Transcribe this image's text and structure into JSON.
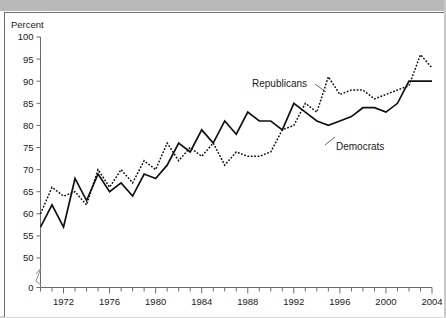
{
  "figure": {
    "y_axis_title": "Percent",
    "series_labels": {
      "republicans": "Republicans",
      "democrats": "Democrats"
    }
  },
  "chart_data": {
    "type": "line",
    "title": "",
    "xlabel": "",
    "ylabel": "Percent",
    "xlim": [
      1970,
      2004
    ],
    "ylim": [
      50,
      100
    ],
    "y_axis_break_to_zero": true,
    "grid": false,
    "legend": "inline-annotations",
    "ytick_labels": [
      "0",
      "50",
      "55",
      "60",
      "65",
      "70",
      "75",
      "80",
      "85",
      "90",
      "95",
      "100"
    ],
    "ytick_values": [
      0,
      50,
      55,
      60,
      65,
      70,
      75,
      80,
      85,
      90,
      95,
      100
    ],
    "xtick_labels": [
      "1972",
      "1976",
      "1980",
      "1984",
      "1988",
      "1992",
      "1996",
      "2000",
      "2004"
    ],
    "xtick_values": [
      1972,
      1976,
      1980,
      1984,
      1988,
      1992,
      1996,
      2000,
      2004
    ],
    "x_minor_ticks_every": 1,
    "x": [
      1970,
      1971,
      1972,
      1973,
      1974,
      1975,
      1976,
      1977,
      1978,
      1979,
      1980,
      1981,
      1982,
      1983,
      1984,
      1985,
      1986,
      1987,
      1988,
      1989,
      1990,
      1991,
      1992,
      1993,
      1994,
      1995,
      1996,
      1997,
      1998,
      1999,
      2000,
      2001,
      2002,
      2003,
      2004
    ],
    "series": [
      {
        "name": "Democrats",
        "style": "solid",
        "color": "#111111",
        "values": [
          57,
          62,
          57,
          68,
          63,
          69,
          65,
          67,
          64,
          69,
          68,
          71,
          76,
          74,
          79,
          76,
          81,
          78,
          83,
          81,
          81,
          79,
          85,
          83,
          81,
          80,
          81,
          82,
          84,
          84,
          83,
          85,
          90,
          90,
          90
        ]
      },
      {
        "name": "Republicans",
        "style": "dotted",
        "color": "#111111",
        "values": [
          60,
          66,
          64,
          65,
          62,
          70,
          66,
          70,
          67,
          72,
          70,
          76,
          72,
          75,
          73,
          76,
          71,
          74,
          73,
          73,
          74,
          79,
          80,
          85,
          83,
          91,
          87,
          88,
          88,
          86,
          87,
          88,
          89,
          96,
          93
        ]
      }
    ],
    "annotations": [
      {
        "text": "Republicans",
        "x": 1992,
        "y": 90
      },
      {
        "text": "Democrats",
        "x": 1997,
        "y": 77
      }
    ]
  }
}
